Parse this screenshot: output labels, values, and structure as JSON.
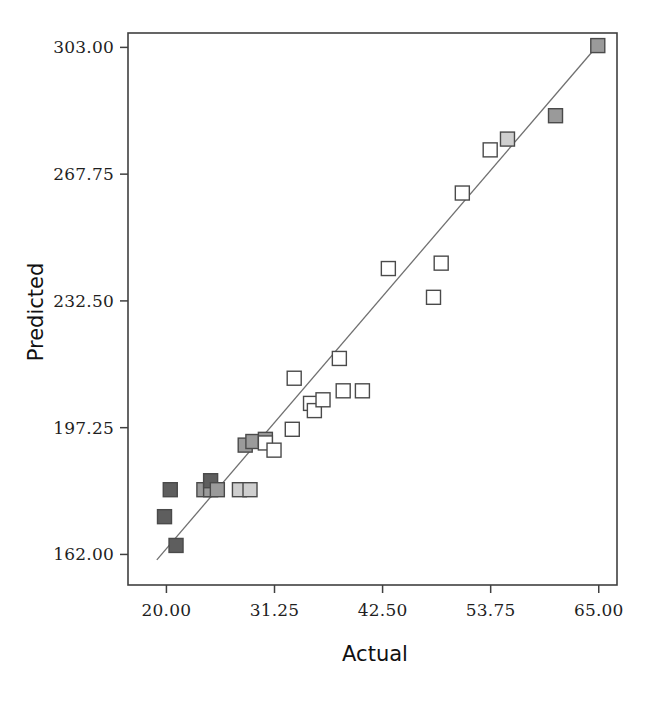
{
  "chart_data": {
    "type": "scatter",
    "title": "",
    "xlabel": "Actual",
    "ylabel": "Predicted",
    "xlim": [
      16.0,
      66.9
    ],
    "ylim": [
      153.5,
      307.0
    ],
    "grid": false,
    "legend": "none",
    "xticks": [
      "20.00",
      "31.25",
      "42.50",
      "53.75",
      "65.00"
    ],
    "xtick_values": [
      20.0,
      31.25,
      42.5,
      53.75,
      65.0
    ],
    "yticks": [
      "162.00",
      "197.25",
      "232.50",
      "267.75",
      "303.00"
    ],
    "ytick_values": [
      162.0,
      197.25,
      232.5,
      267.75,
      303.0
    ],
    "marker_shape": "square",
    "marker_colors": {
      "dark": "#5e5e5e",
      "medium": "#9a9a9a",
      "light": "#cfcfcf",
      "open": "#ffffff",
      "edge": "#4a4a4a"
    },
    "fit_line": {
      "label": "regression line",
      "color": "#707070",
      "x1": 19.0,
      "y1": 160.5,
      "x2": 64.9,
      "y2": 303.6
    },
    "points": [
      {
        "x": 19.8,
        "y": 172.5,
        "shade": "dark"
      },
      {
        "x": 20.4,
        "y": 180.0,
        "shade": "dark"
      },
      {
        "x": 21.0,
        "y": 164.5,
        "shade": "dark"
      },
      {
        "x": 23.9,
        "y": 180.0,
        "shade": "medium"
      },
      {
        "x": 24.6,
        "y": 180.0,
        "shade": "medium"
      },
      {
        "x": 24.6,
        "y": 182.5,
        "shade": "dark"
      },
      {
        "x": 25.3,
        "y": 180.0,
        "shade": "medium"
      },
      {
        "x": 27.6,
        "y": 180.0,
        "shade": "light"
      },
      {
        "x": 28.7,
        "y": 180.0,
        "shade": "light"
      },
      {
        "x": 28.2,
        "y": 192.4,
        "shade": "medium"
      },
      {
        "x": 29.0,
        "y": 193.4,
        "shade": "medium"
      },
      {
        "x": 30.3,
        "y": 194.0,
        "shade": "medium"
      },
      {
        "x": 30.3,
        "y": 193.0,
        "shade": "open"
      },
      {
        "x": 31.2,
        "y": 191.0,
        "shade": "open"
      },
      {
        "x": 33.1,
        "y": 196.8,
        "shade": "open"
      },
      {
        "x": 33.3,
        "y": 211.0,
        "shade": "open"
      },
      {
        "x": 35.0,
        "y": 204.0,
        "shade": "open"
      },
      {
        "x": 35.4,
        "y": 202.0,
        "shade": "open"
      },
      {
        "x": 36.3,
        "y": 205.0,
        "shade": "open"
      },
      {
        "x": 38.0,
        "y": 216.5,
        "shade": "open"
      },
      {
        "x": 38.4,
        "y": 207.5,
        "shade": "open"
      },
      {
        "x": 40.4,
        "y": 207.5,
        "shade": "open"
      },
      {
        "x": 43.1,
        "y": 241.5,
        "shade": "open"
      },
      {
        "x": 47.8,
        "y": 233.5,
        "shade": "open"
      },
      {
        "x": 48.6,
        "y": 243.0,
        "shade": "open"
      },
      {
        "x": 50.8,
        "y": 262.5,
        "shade": "open"
      },
      {
        "x": 53.7,
        "y": 274.5,
        "shade": "open"
      },
      {
        "x": 55.5,
        "y": 277.5,
        "shade": "light"
      },
      {
        "x": 60.5,
        "y": 284.0,
        "shade": "medium"
      },
      {
        "x": 64.9,
        "y": 303.5,
        "shade": "medium"
      }
    ]
  },
  "axes": {
    "frame": {
      "left": 128,
      "right": 617,
      "top": 33,
      "bottom": 585
    },
    "tick_length": 8
  }
}
